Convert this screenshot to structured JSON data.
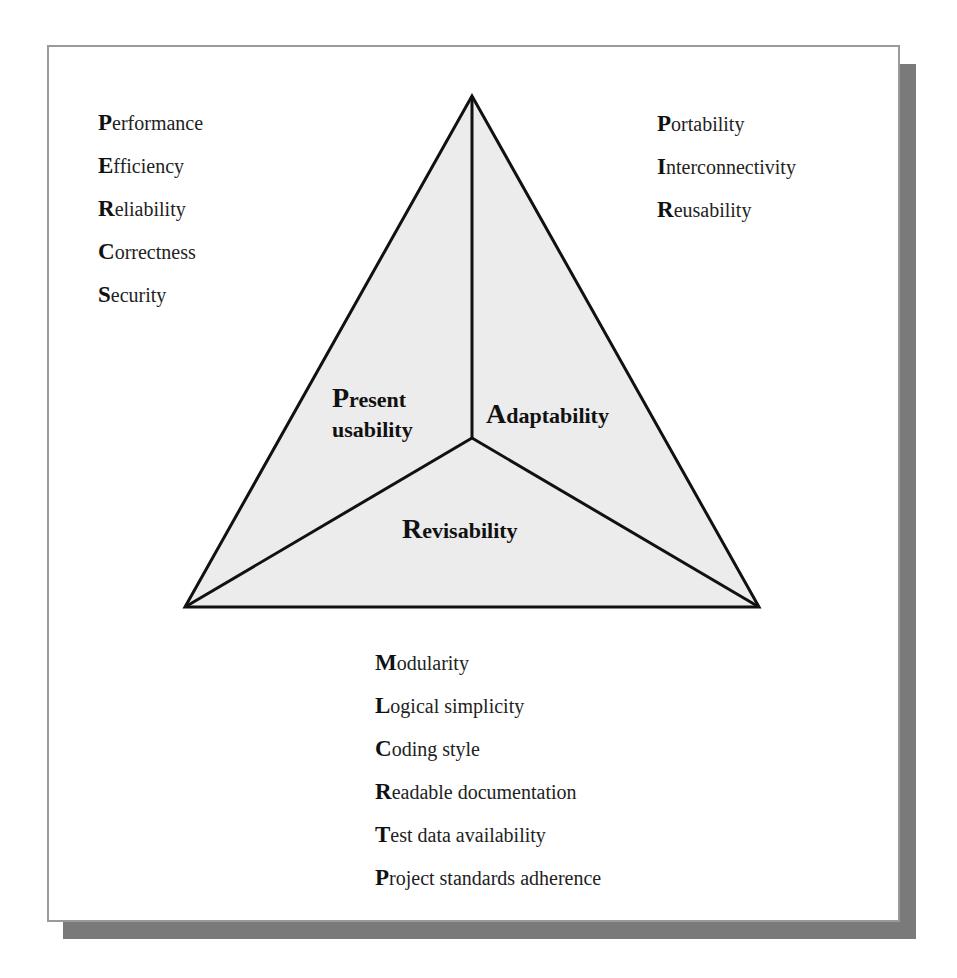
{
  "diagram": {
    "title": "",
    "triangle": {
      "fill_color": "#ececec",
      "stroke_color": "#111111",
      "apex": [
        472,
        96
      ],
      "bottom_left": [
        185,
        607
      ],
      "bottom_right": [
        759,
        607
      ],
      "center": [
        472,
        438
      ]
    },
    "regions": [
      {
        "name": "present-usability",
        "initial": "P",
        "rest_line1": "resent",
        "line2": "usability",
        "full": "Present usability"
      },
      {
        "name": "adaptability",
        "initial": "A",
        "rest": "daptability",
        "full": "Adaptability"
      },
      {
        "name": "revisability",
        "initial": "R",
        "rest": "evisability",
        "full": "Revisability"
      }
    ],
    "lists": {
      "present_usability": [
        {
          "initial": "P",
          "rest": "erformance"
        },
        {
          "initial": "E",
          "rest": "fficiency"
        },
        {
          "initial": "R",
          "rest": "eliability"
        },
        {
          "initial": "C",
          "rest": "orrectness"
        },
        {
          "initial": "S",
          "rest": "ecurity"
        }
      ],
      "adaptability": [
        {
          "initial": "P",
          "rest": "ortability"
        },
        {
          "initial": "I",
          "rest": "nterconnectivity"
        },
        {
          "initial": "R",
          "rest": "eusability"
        }
      ],
      "revisability": [
        {
          "initial": "M",
          "rest": "odularity"
        },
        {
          "initial": "L",
          "rest": "ogical simplicity"
        },
        {
          "initial": "C",
          "rest": "oding style"
        },
        {
          "initial": "R",
          "rest": "eadable documentation"
        },
        {
          "initial": "T",
          "rest": "est data availability"
        },
        {
          "initial": "P",
          "rest": "roject standards adherence"
        }
      ]
    },
    "colors": {
      "frame_border": "#9a9a9a",
      "shadow": "#7a7a7a",
      "text": "#1a1a1a"
    }
  }
}
